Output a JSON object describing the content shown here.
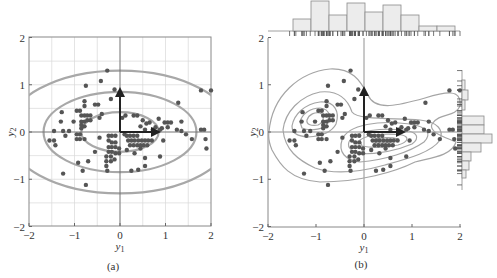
{
  "chart_data": [
    {
      "panel": "a",
      "type": "scatter",
      "caption": "(a)",
      "xlabel": "y1",
      "ylabel": "y2",
      "xlim": [
        -2,
        2
      ],
      "ylim": [
        -2,
        2
      ],
      "xticks": [
        "-2",
        "-1",
        "0",
        "1",
        "2"
      ],
      "yticks": [
        "-2",
        "-1",
        "0",
        "1",
        "2"
      ],
      "grid": true,
      "overlays": {
        "ellipses": [
          {
            "rx": 0.85,
            "ry": 0.42
          },
          {
            "rx": 1.68,
            "ry": 0.85
          },
          {
            "rx": 2.5,
            "ry": 1.3
          }
        ],
        "arrows": [
          {
            "from": [
              0,
              0
            ],
            "to": [
              0,
              0.95
            ]
          },
          {
            "from": [
              0,
              0
            ],
            "to": [
              0.85,
              0
            ]
          }
        ]
      }
    },
    {
      "panel": "b",
      "type": "scatter",
      "caption": "(b)",
      "xlabel": "y1",
      "ylabel": "y2",
      "xlim": [
        -2,
        2
      ],
      "ylim": [
        -2,
        2
      ],
      "xticks": [
        "-2",
        "-1",
        "0",
        "1",
        "2"
      ],
      "yticks": [
        "-2",
        "-1",
        "0",
        "1",
        "2"
      ],
      "grid": false,
      "overlays": {
        "density_contours": true,
        "arrows": [
          {
            "from": [
              0,
              0
            ],
            "to": [
              0,
              0.95
            ]
          },
          {
            "from": [
              0,
              0
            ],
            "to": [
              0.85,
              0
            ]
          }
        ],
        "marginal_hist_top": {
          "bins": [
            -1.5,
            -1.12,
            -0.75,
            -0.37,
            0.0,
            0.37,
            0.75,
            1.12,
            1.5,
            1.87
          ],
          "counts": [
            4,
            10,
            5,
            9,
            6,
            8,
            5,
            2,
            2
          ]
        },
        "marginal_hist_right": {
          "bin_edges": [
            1.0,
            0.8,
            0.6,
            0.4,
            0.2,
            0.0,
            -0.2,
            -0.4,
            -0.6,
            -0.8,
            -1.0
          ],
          "counts": [
            1,
            2,
            1,
            6,
            6,
            8,
            5,
            3,
            2,
            1
          ]
        }
      }
    }
  ],
  "points": [
    [
      -1.55,
      -0.18
    ],
    [
      -1.45,
      -0.18
    ],
    [
      -1.42,
      -0.28
    ],
    [
      -1.45,
      0.02
    ],
    [
      -1.28,
      0.42
    ],
    [
      -1.3,
      0.22
    ],
    [
      -1.25,
      0.02
    ],
    [
      -1.2,
      -0.08
    ],
    [
      -1.12,
      0.02
    ],
    [
      -1.02,
      0.22
    ],
    [
      -0.95,
      0.45
    ],
    [
      -0.88,
      0.45
    ],
    [
      -0.78,
      0.65
    ],
    [
      -0.78,
      0.55
    ],
    [
      -0.85,
      0.35
    ],
    [
      -0.78,
      0.35
    ],
    [
      -0.72,
      0.35
    ],
    [
      -0.65,
      0.35
    ],
    [
      -0.85,
      0.22
    ],
    [
      -0.78,
      0.22
    ],
    [
      -0.72,
      0.25
    ],
    [
      -0.65,
      0.25
    ],
    [
      -0.85,
      0.15
    ],
    [
      -0.78,
      0.12
    ],
    [
      -0.85,
      0.08
    ],
    [
      -0.95,
      -0.05
    ],
    [
      -0.88,
      -0.05
    ],
    [
      -0.95,
      -0.15
    ],
    [
      -0.88,
      -0.15
    ],
    [
      -0.78,
      -0.15
    ],
    [
      -0.55,
      0.58
    ],
    [
      -0.48,
      0.58
    ],
    [
      -0.4,
      0.38
    ],
    [
      -0.45,
      0.3
    ],
    [
      -0.42,
      1.08
    ],
    [
      -0.28,
      1.3
    ],
    [
      -0.2,
      0.7
    ],
    [
      -0.12,
      0.9
    ],
    [
      -0.75,
      0.98
    ],
    [
      -0.92,
      -0.65
    ],
    [
      -0.82,
      -0.82
    ],
    [
      -0.75,
      -1.12
    ],
    [
      -0.7,
      -0.62
    ],
    [
      -0.55,
      -0.42
    ],
    [
      -1.25,
      -0.88
    ],
    [
      -0.45,
      -0.12
    ],
    [
      -0.25,
      -0.08
    ],
    [
      -0.18,
      -0.08
    ],
    [
      -0.1,
      -0.08
    ],
    [
      -0.25,
      -0.18
    ],
    [
      -0.18,
      -0.22
    ],
    [
      -0.1,
      -0.22
    ],
    [
      -0.25,
      -0.32
    ],
    [
      -0.18,
      -0.32
    ],
    [
      -0.1,
      -0.32
    ],
    [
      -0.02,
      -0.35
    ],
    [
      -0.25,
      -0.42
    ],
    [
      -0.18,
      -0.42
    ],
    [
      -0.1,
      -0.45
    ],
    [
      -0.02,
      -0.45
    ],
    [
      -0.3,
      -0.52
    ],
    [
      -0.2,
      -0.52
    ],
    [
      -0.3,
      -0.62
    ],
    [
      -0.2,
      -0.62
    ],
    [
      -0.12,
      -0.58
    ],
    [
      -0.3,
      -0.72
    ],
    [
      -0.28,
      -0.82
    ],
    [
      0.05,
      0.3
    ],
    [
      0.12,
      0.35
    ],
    [
      0.3,
      0.35
    ],
    [
      0.38,
      0.35
    ],
    [
      0.1,
      -0.05
    ],
    [
      0.15,
      -0.08
    ],
    [
      0.22,
      -0.08
    ],
    [
      0.3,
      -0.08
    ],
    [
      0.38,
      -0.08
    ],
    [
      0.18,
      -0.18
    ],
    [
      0.25,
      -0.18
    ],
    [
      0.32,
      -0.18
    ],
    [
      0.4,
      -0.18
    ],
    [
      0.48,
      -0.18
    ],
    [
      0.55,
      -0.18
    ],
    [
      0.62,
      -0.18
    ],
    [
      0.7,
      -0.18
    ],
    [
      0.22,
      -0.28
    ],
    [
      0.3,
      -0.28
    ],
    [
      0.38,
      -0.28
    ],
    [
      0.45,
      -0.28
    ],
    [
      0.52,
      -0.28
    ],
    [
      0.6,
      -0.28
    ],
    [
      0.15,
      -0.38
    ],
    [
      0.32,
      -0.45
    ],
    [
      0.45,
      -0.35
    ],
    [
      0.55,
      -0.55
    ],
    [
      0.55,
      -0.72
    ],
    [
      0.4,
      -0.8
    ],
    [
      0.25,
      -0.82
    ],
    [
      0.5,
      0.25
    ],
    [
      0.45,
      0.12
    ],
    [
      0.58,
      0.18
    ],
    [
      0.65,
      0.2
    ],
    [
      0.55,
      0.05
    ],
    [
      0.72,
      0.05
    ],
    [
      0.78,
      0.1
    ],
    [
      0.85,
      0.28
    ],
    [
      0.88,
      0.05
    ],
    [
      0.92,
      0.08
    ],
    [
      0.98,
      0.2
    ],
    [
      1.05,
      0.2
    ],
    [
      1.12,
      0.2
    ],
    [
      1.05,
      0.1
    ],
    [
      0.95,
      -0.18
    ],
    [
      0.88,
      -0.52
    ],
    [
      1.28,
      0.62
    ],
    [
      1.25,
      0.05
    ],
    [
      1.35,
      0.22
    ],
    [
      1.35,
      0.02
    ],
    [
      1.45,
      -0.05
    ],
    [
      1.58,
      -0.15
    ],
    [
      1.78,
      0.05
    ],
    [
      1.85,
      0.05
    ],
    [
      1.88,
      -0.15
    ],
    [
      1.9,
      -0.35
    ],
    [
      1.78,
      0.88
    ],
    [
      2.0,
      0.88
    ]
  ]
}
